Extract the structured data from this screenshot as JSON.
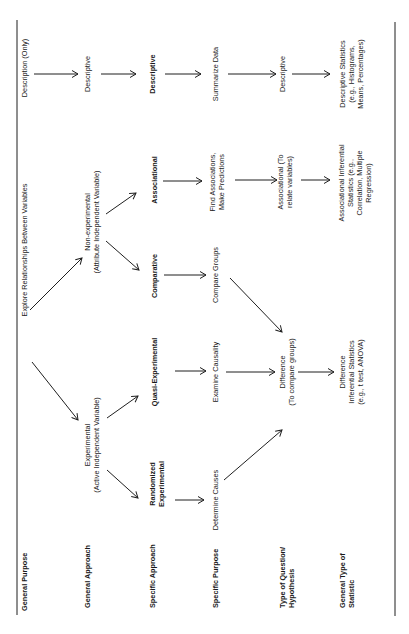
{
  "diagram": {
    "orientation": "rotated-90-ccw",
    "row_labels": [
      {
        "id": "general-purpose",
        "lines": [
          "General Purpose"
        ]
      },
      {
        "id": "general-approach",
        "lines": [
          "General Approach"
        ]
      },
      {
        "id": "specific-approach",
        "lines": [
          "Specific Approach"
        ]
      },
      {
        "id": "specific-purpose",
        "lines": [
          "Specific Purpose"
        ]
      },
      {
        "id": "type-of-question",
        "lines": [
          "Type of  Question/",
          "Hypothesis"
        ]
      },
      {
        "id": "general-type-of-statistic",
        "lines": [
          "General Type of",
          "Statistic"
        ]
      }
    ],
    "general_purpose": {
      "explore": "Explore Relationships Between Variables",
      "description": "Description (Only)"
    },
    "general_approach": {
      "experimental": [
        "Experimental",
        "(Active Independent Variable)"
      ],
      "non_experimental": [
        "Non-experimental",
        "(Attribute Independent Variable)"
      ],
      "descriptive": "Descriptive"
    },
    "specific_approach": {
      "randomized": [
        "Randomized",
        "Experimental"
      ],
      "quasi": "Quasi-Experimental",
      "comparative": "Comparative",
      "associational": "Associational",
      "descriptive": "Descriptive"
    },
    "specific_purpose": {
      "determine_causes": "Determine Causes",
      "examine_causality": "Examine Causality",
      "compare_groups": "Compare Groups",
      "find_associations": [
        "Find Associations,",
        "Make Predictions"
      ],
      "summarize": "Summarize Data"
    },
    "type_of_question": {
      "difference": [
        "Difference",
        "(To compare groups)"
      ],
      "associational": [
        "Associational  (To",
        "relate variables)"
      ],
      "descriptive": "Descriptive"
    },
    "general_type_of_statistic": {
      "difference": [
        "Difference",
        "Inferential Statistics",
        "(e.g., t test, ANOVA)"
      ],
      "associational": [
        "Associational Inferential",
        "Statistics (e.g.,",
        "Correlation, Multiple",
        "Regression)"
      ],
      "descriptive": [
        "Descriptive Statistics",
        "(e.g., Histograms,",
        "Means, Percentages)"
      ]
    }
  }
}
